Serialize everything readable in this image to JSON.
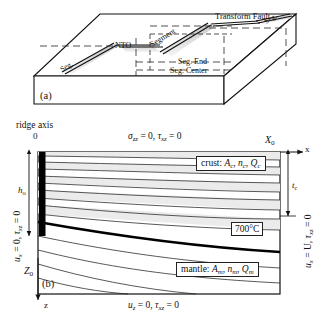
{
  "figure": {
    "panels": [
      {
        "tag": "(a)",
        "name": "three-dimensional-block-diagram",
        "labels": {
          "transform_fault": "Transform Fault",
          "nto": "NTO",
          "segment": "Segment",
          "seg_left": "Seg.",
          "seg_right": "Seg.",
          "seg_end": "Seg. End",
          "seg_center": "Seg. Center"
        }
      },
      {
        "tag": "(b)",
        "name": "cross-section-model-domain",
        "axes": {
          "ridge_axis": "ridge axis",
          "origin": "0",
          "x_axis": "x",
          "z_axis": "z",
          "x_extent": "X",
          "x_extent_sub": "o",
          "z_extent": "Z",
          "z_extent_sub": "o"
        },
        "boundary_conditions": {
          "top": "σzz = 0, τxz = 0",
          "top_parts": {
            "s1": "σ",
            "s1sub": "zz",
            "eq1": "= 0,",
            "s2": "τ",
            "s2sub": "xz",
            "eq2": "= 0"
          },
          "left_parts": {
            "s1": "u",
            "s1sub": "x",
            "eq1": "= 0,",
            "s2": "τ",
            "s2sub": "xz",
            "eq2": "= 0"
          },
          "right_parts": {
            "s1": "u",
            "s1sub": "x",
            "eq1": "= U,",
            "s2": "τ",
            "s2sub": "xz",
            "eq2": "= 0"
          },
          "bottom_parts": {
            "s1": "u",
            "s1sub": "z",
            "eq1": "= 0,",
            "s2": "τ",
            "s2sub": "xz",
            "eq2": "= 0"
          }
        },
        "markers": {
          "h_o": "h",
          "h_o_sub": "o",
          "t_c": "t",
          "t_c_sub": "c"
        },
        "material_layers": [
          {
            "name": "crust",
            "label": "crust:",
            "params": [
              "A",
              "n",
              "Q"
            ],
            "subscript": "c"
          },
          {
            "name": "mantle",
            "label": "mantle:",
            "params": [
              "A",
              "n",
              "Q"
            ],
            "subscript": "m"
          }
        ],
        "isotherm_label": {
          "value": "700",
          "unit": "°C"
        }
      }
    ],
    "colors": {
      "line": "#1a1a1a",
      "band_fill": "#e9e9e9",
      "shade_fill": "#d8d8d8",
      "background": "#ffffff"
    }
  }
}
